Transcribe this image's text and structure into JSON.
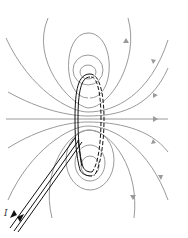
{
  "diagram": {
    "current_label": "I",
    "colors": {
      "field_lines": "#9a9a9a",
      "wire": "#111111",
      "background": "#ffffff"
    },
    "elements": [
      {
        "name": "current-loop",
        "style": "solid front, dashed back"
      },
      {
        "name": "lead-wires",
        "count": 2,
        "arrows": "opposite directions"
      },
      {
        "name": "field-lines-top",
        "count": 5
      },
      {
        "name": "field-lines-bottom",
        "count": 5
      },
      {
        "name": "field-line-axis",
        "count": 1,
        "direction": "right"
      }
    ]
  }
}
